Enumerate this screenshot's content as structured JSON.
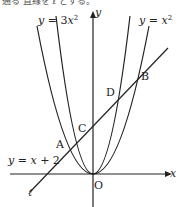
{
  "header_fragment": "通る 直線を ℓ とする。",
  "axes": {
    "x_label": "x",
    "y_label": "y",
    "origin_label": "O"
  },
  "curves": [
    {
      "name": "parabola-3x2",
      "label": "y = 3x²",
      "label_parts": [
        "y",
        " = 3",
        "x",
        "2"
      ]
    },
    {
      "name": "parabola-x2",
      "label": "y = x²",
      "label_parts": [
        "y",
        " = ",
        "x",
        "2"
      ]
    }
  ],
  "line": {
    "label": "y = x + 2",
    "label_parts": [
      "y",
      " = ",
      "x",
      " + 2"
    ],
    "name_label": "ℓ"
  },
  "points": [
    {
      "name": "A",
      "label": "A"
    },
    {
      "name": "B",
      "label": "B"
    },
    {
      "name": "C",
      "label": "C"
    },
    {
      "name": "D",
      "label": "D"
    },
    {
      "name": "O",
      "label": "O"
    }
  ],
  "colors": {
    "stroke": "#222222",
    "background": "#ffffff"
  }
}
